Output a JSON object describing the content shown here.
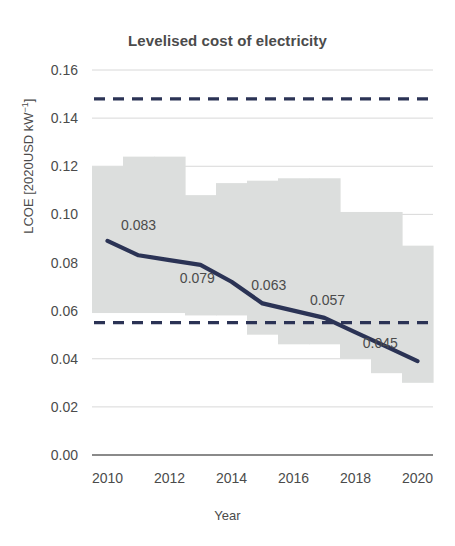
{
  "chart_data": {
    "type": "line",
    "title": "Levelised cost of electricity",
    "xlabel": "Year",
    "ylabel": "LCOE [2020USD kW⁻¹]",
    "ylabel_plain": "LCOE [2020USD kW-1]",
    "xlim": [
      2009.5,
      2020.5
    ],
    "ylim": [
      0.0,
      0.165
    ],
    "grid": true,
    "legend": "none",
    "x": [
      2010,
      2011,
      2012,
      2013,
      2014,
      2015,
      2016,
      2017,
      2018,
      2019,
      2020
    ],
    "yticks": [
      0.0,
      0.02,
      0.04,
      0.06,
      0.08,
      0.1,
      0.12,
      0.14,
      0.16
    ],
    "ytick_labels": [
      "0.00",
      "0.02",
      "0.04",
      "0.06",
      "0.08",
      "0.10",
      "0.12",
      "0.14",
      "0.16"
    ],
    "xticks": [
      2010,
      2012,
      2014,
      2016,
      2018,
      2020
    ],
    "xtick_labels": [
      "2010",
      "2012",
      "2014",
      "2016",
      "2018",
      "2020"
    ],
    "series": [
      {
        "name": "Global weighted-average LCOE",
        "type": "line",
        "color": "#2b3355",
        "values": [
          0.089,
          0.083,
          0.081,
          0.079,
          0.072,
          0.063,
          0.06,
          0.057,
          0.051,
          0.045,
          0.039
        ]
      },
      {
        "name": "LCOE range (5th–95th percentile)",
        "type": "range-band",
        "color": "#dcdedd",
        "lower": [
          0.059,
          0.059,
          0.059,
          0.058,
          0.058,
          0.05,
          0.046,
          0.046,
          0.04,
          0.034,
          0.03
        ],
        "upper": [
          0.12,
          0.124,
          0.124,
          0.108,
          0.113,
          0.114,
          0.115,
          0.115,
          0.101,
          0.101,
          0.087
        ]
      },
      {
        "name": "Fossil fuel cost range upper bound",
        "type": "hline-dashed",
        "color": "#2b3355",
        "value": 0.148
      },
      {
        "name": "Fossil fuel cost range lower bound",
        "type": "hline-dashed",
        "color": "#2b3355",
        "value": 0.055
      }
    ],
    "annotations": [
      {
        "label": "0.083",
        "x": 2011,
        "y": 0.083,
        "text_x": 2011.0,
        "text_y": 0.0955
      },
      {
        "label": "0.079",
        "x": 2013,
        "y": 0.079,
        "text_x": 2012.9,
        "text_y": 0.0735
      },
      {
        "label": "0.063",
        "x": 2015,
        "y": 0.063,
        "text_x": 2015.2,
        "text_y": 0.0705
      },
      {
        "label": "0.057",
        "x": 2017,
        "y": 0.057,
        "text_x": 2017.1,
        "text_y": 0.0645
      },
      {
        "label": "0.045",
        "x": 2019,
        "y": 0.045,
        "text_x": 2018.8,
        "text_y": 0.0465
      }
    ],
    "colors": {
      "line": "#2b3355",
      "band": "#dcdedd",
      "grid": "#bfbfbf",
      "axis": "#8a8a8a",
      "text": "#4b4b4b",
      "background": "#ffffff"
    }
  }
}
